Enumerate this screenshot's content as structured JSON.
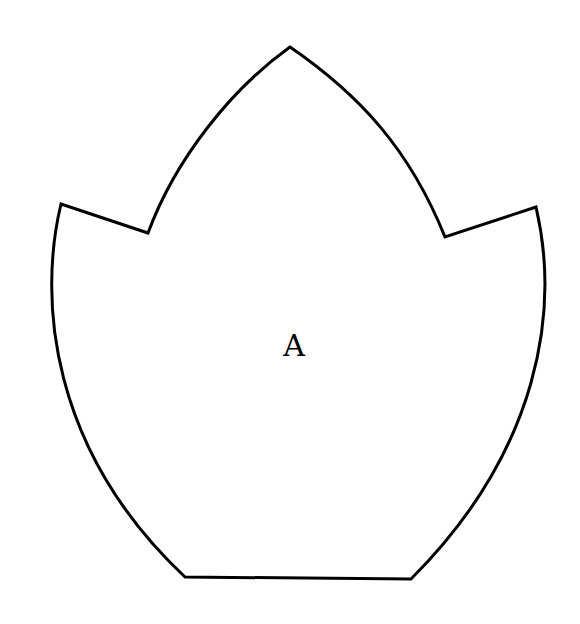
{
  "diagram": {
    "type": "pattern-piece",
    "shape": "tulip / crown outline",
    "label": "A",
    "colors": {
      "background": "#ffffff",
      "stroke": "#000000"
    },
    "key_points": {
      "top_tip": [
        290,
        47
      ],
      "left_tip": [
        61,
        204
      ],
      "left_notch": [
        148,
        233
      ],
      "right_notch": [
        445,
        237
      ],
      "right_tip": [
        536,
        207
      ],
      "bottom_left": [
        185,
        577
      ],
      "bottom_right": [
        411,
        579
      ]
    }
  }
}
